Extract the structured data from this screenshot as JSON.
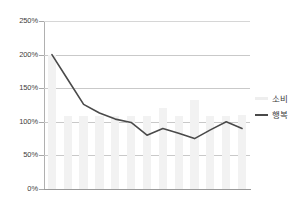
{
  "chart_data": {
    "type": "bar",
    "title": "",
    "subtitle": "",
    "xlabel": "",
    "ylabel": "",
    "ylim": [
      0,
      250
    ],
    "yunit": "%",
    "ytick_labels": [
      "250%",
      "200%",
      "150%",
      "100%",
      "50%",
      "0%"
    ],
    "ytick_values": [
      250,
      200,
      150,
      100,
      50,
      0
    ],
    "grid": true,
    "x_axis_visible": true,
    "x_tick_labels": [],
    "legend_position": "right",
    "categories": [
      "1",
      "2",
      "3",
      "4",
      "5",
      "6",
      "7",
      "8",
      "9",
      "10",
      "11",
      "12",
      "13"
    ],
    "series": [
      {
        "name": "소비",
        "type": "bar",
        "color": "#f2f2f2",
        "values": [
          200,
          108,
          108,
          108,
          108,
          108,
          108,
          120,
          108,
          133,
          108,
          108,
          110
        ]
      },
      {
        "name": "행복",
        "type": "line",
        "color": "#4a4a4a",
        "values": [
          200,
          163,
          126,
          113,
          104,
          99,
          80,
          90,
          83,
          75,
          88,
          100,
          90
        ]
      }
    ]
  },
  "legend": {
    "items": [
      {
        "label": "소비",
        "marker": "bar-swatch"
      },
      {
        "label": "행복",
        "marker": "line-swatch"
      }
    ]
  }
}
